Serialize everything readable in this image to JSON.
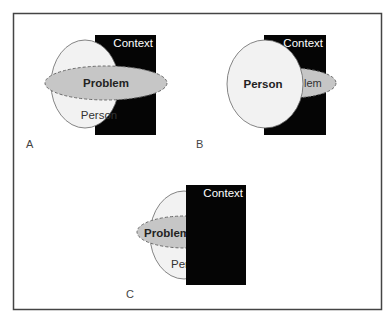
{
  "figure": {
    "panels": [
      {
        "id": "A",
        "label": "A",
        "context_label": "Context",
        "problem_label": "Problem",
        "person_label": "Person"
      },
      {
        "id": "B",
        "label": "B",
        "context_label": "Context",
        "problem_label": "lem",
        "person_label": "Person"
      },
      {
        "id": "C",
        "label": "C",
        "context_label": "Context",
        "problem_label": "Problem",
        "person_label": "Per"
      }
    ],
    "colors": {
      "frame": "#444444",
      "context_fill": "#050505",
      "context_text": "#ffffff",
      "person_fill": "#f2f2f2",
      "person_stroke": "#666666",
      "problem_fill": "#c6c6c6",
      "problem_stroke": "#6a6a6a",
      "text": "#222222",
      "panel_label": "#444444"
    }
  }
}
